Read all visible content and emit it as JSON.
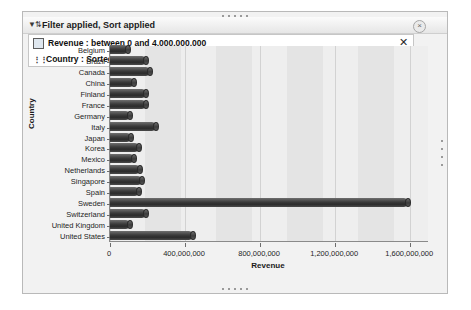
{
  "window": {
    "title": "Filter applied, Sort applied",
    "filter_glyph": "icon-filter-sort",
    "close_label": "×",
    "grip_label": "drag-grip"
  },
  "filter_panel": {
    "close_label": "✕",
    "rows": [
      {
        "icon": "field-box-icon",
        "text": "Revenue : between 0 and 4,000,000,000"
      },
      {
        "icon": "sort-icon",
        "text": "Country : Sorted by label, descending"
      }
    ]
  },
  "chart_data": {
    "type": "bar",
    "orientation": "horizontal",
    "title": "",
    "xlabel": "Revenue",
    "ylabel": "Country",
    "xlim": [
      0,
      1700000000
    ],
    "xticks": [
      0,
      400000000,
      800000000,
      1200000000,
      1600000000
    ],
    "xtick_labels": [
      "0",
      "400,000,000",
      "800,000,000",
      "1,200,000,000",
      "1,600,000,000"
    ],
    "grid": true,
    "legend": "none",
    "bar_color": "#333333",
    "categories": [
      "Belgium",
      "Brazil",
      "Canada",
      "China",
      "Finland",
      "France",
      "Germany",
      "Italy",
      "Japan",
      "Korea",
      "Mexico",
      "Netherlands",
      "Singapore",
      "Spain",
      "Sweden",
      "Switzerland",
      "United Kingdom",
      "United States"
    ],
    "values": [
      95000000,
      190000000,
      215000000,
      130000000,
      190000000,
      190000000,
      105000000,
      245000000,
      110000000,
      155000000,
      130000000,
      160000000,
      170000000,
      155000000,
      1590000000,
      190000000,
      105000000,
      440000000
    ]
  }
}
